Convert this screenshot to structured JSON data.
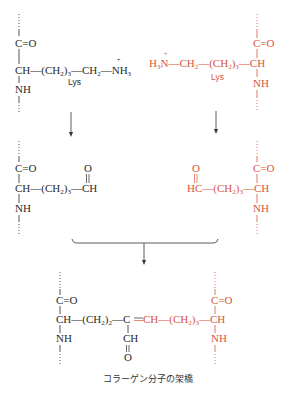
{
  "colors": {
    "black": "#2a2a2a",
    "red": "#d8553c",
    "arrow": "#333333"
  },
  "caption": "コラーゲン分子の架橋",
  "top_left": {
    "color_key": "black",
    "carbonyl": "C=O",
    "alpha_ch": "CH",
    "side_chain": "—(CH₂)₃—CH₂—",
    "amine": "NH₃",
    "amine_charge": "+",
    "amide_nh": "NH",
    "residue_label": "Lys"
  },
  "top_right": {
    "color_key": "red",
    "amine": "H₃N",
    "amine_charge": "+",
    "side_chain": "—CH₂—(CH₂)₃—",
    "alpha_ch": "CH",
    "carbonyl": "C=O",
    "amide_nh": "NH",
    "residue_label": "Lys"
  },
  "middle_left": {
    "color_key": "black",
    "carbonyl": "C=O",
    "alpha_ch": "CH",
    "side_chain": "—(CH₂)₃—",
    "aldehyde_ch": "CH",
    "aldehyde_o": "O",
    "amide_nh": "NH"
  },
  "middle_right": {
    "color_key": "red",
    "aldehyde_o": "O",
    "aldehyde_hc": "HC",
    "side_chain": "—(CH₂)₃—",
    "alpha_ch": "CH",
    "carbonyl": "C=O",
    "amide_nh": "NH"
  },
  "bottom": {
    "left_carbonyl": "C=O",
    "left_alpha_ch": "CH",
    "left_chain": "—(CH₂)₂—",
    "central_c": "C",
    "double_bond": "=",
    "right_ch": "CH",
    "right_chain": "—(CH₂)₃—",
    "right_alpha_ch": "CH",
    "right_carbonyl": "C=O",
    "left_nh": "NH",
    "right_nh": "NH",
    "branch_ch": "CH",
    "branch_o": "O"
  },
  "arrows": [
    {
      "from": "top_left",
      "to": "middle_left"
    },
    {
      "from": "top_right",
      "to": "middle_right"
    },
    {
      "from": "middle_both",
      "to": "bottom",
      "style": "bracket-merge"
    }
  ]
}
